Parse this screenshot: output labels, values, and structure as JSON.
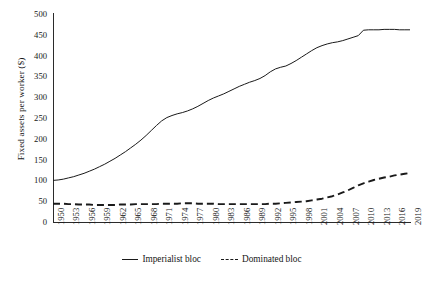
{
  "chart_data": {
    "type": "line",
    "title": "",
    "xlabel": "",
    "ylabel": "Fixed assets per worker ($)",
    "ylim": [
      0,
      500
    ],
    "yticks": [
      0,
      50,
      100,
      150,
      200,
      250,
      300,
      350,
      400,
      450,
      500
    ],
    "grid": false,
    "legend_position": "bottom-center",
    "x": [
      1950,
      1951,
      1952,
      1953,
      1954,
      1955,
      1956,
      1957,
      1958,
      1959,
      1960,
      1961,
      1962,
      1963,
      1964,
      1965,
      1966,
      1967,
      1968,
      1969,
      1970,
      1971,
      1972,
      1973,
      1974,
      1975,
      1976,
      1977,
      1978,
      1979,
      1980,
      1981,
      1982,
      1983,
      1984,
      1985,
      1986,
      1987,
      1988,
      1989,
      1990,
      1991,
      1992,
      1993,
      1994,
      1995,
      1996,
      1997,
      1998,
      1999,
      2000,
      2001,
      2002,
      2003,
      2004,
      2005,
      2006,
      2007,
      2008,
      2009,
      2010,
      2011,
      2012,
      2013,
      2014,
      2015,
      2016,
      2017,
      2018,
      2019
    ],
    "xticks": [
      "1950",
      "1953",
      "1956",
      "1959",
      "1962",
      "1965",
      "1968",
      "1971",
      "1974",
      "1977",
      "1980",
      "1983",
      "1986",
      "1989",
      "1992",
      "1995",
      "1998",
      "2001",
      "2004",
      "2007",
      "2010",
      "2013",
      "2016",
      "2019"
    ],
    "series": [
      {
        "name": "Imperialist bloc",
        "style": "solid",
        "color": "#1a1a1a",
        "values": [
          100,
          101,
          103,
          106,
          109,
          113,
          117,
          122,
          127,
          133,
          139,
          146,
          153,
          161,
          169,
          178,
          187,
          197,
          208,
          220,
          232,
          243,
          251,
          256,
          260,
          263,
          267,
          272,
          278,
          285,
          292,
          298,
          303,
          308,
          314,
          320,
          326,
          331,
          336,
          340,
          345,
          352,
          361,
          368,
          372,
          375,
          381,
          388,
          396,
          404,
          412,
          419,
          424,
          428,
          431,
          433,
          436,
          440,
          444,
          448,
          461,
          462,
          462,
          462,
          463,
          463,
          463,
          462,
          462,
          462
        ]
      },
      {
        "name": "Dominated bloc",
        "style": "dashed",
        "color": "#1a1a1a",
        "values": [
          44,
          44,
          44,
          43,
          43,
          42,
          42,
          42,
          41,
          41,
          41,
          41,
          41,
          42,
          42,
          42,
          43,
          43,
          43,
          43,
          43,
          44,
          44,
          44,
          44,
          45,
          45,
          45,
          44,
          44,
          44,
          44,
          43,
          43,
          43,
          43,
          43,
          43,
          43,
          43,
          43,
          43,
          44,
          44,
          45,
          46,
          47,
          48,
          49,
          50,
          52,
          54,
          56,
          59,
          62,
          66,
          71,
          76,
          82,
          88,
          93,
          97,
          101,
          104,
          107,
          109,
          112,
          114,
          116,
          118
        ]
      }
    ]
  },
  "legend": {
    "items": [
      {
        "label": "Imperialist bloc",
        "style": "solid"
      },
      {
        "label": "Dominated bloc",
        "style": "dashed"
      }
    ]
  }
}
